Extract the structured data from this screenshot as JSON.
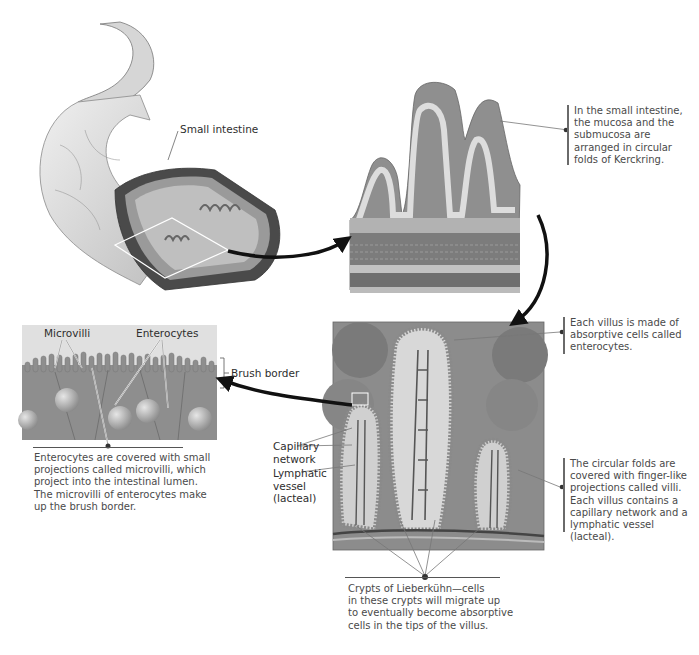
{
  "figure": {
    "panels": {
      "intestine": {
        "label": "Small intestine"
      },
      "folds": {
        "caption": [
          "In the small intestine,",
          "the mucosa and the",
          "submucosa are",
          "arranged in circular",
          "folds of Kerckring."
        ]
      },
      "villus": {
        "caption": [
          "Each villus is made of",
          "absorptive cells called",
          "enterocytes."
        ],
        "caption2": [
          "The circular folds are",
          "covered with finger-like",
          "projections called villi.",
          "Each villus contains a",
          "capillary network and a",
          "lymphatic vessel (lacteal)."
        ],
        "labels": {
          "capillary": [
            "Capillary",
            "network"
          ],
          "lymphatic": [
            "Lymphatic",
            "vessel",
            "(lacteal)"
          ]
        },
        "crypts_caption": [
          "Crypts of Lieberkühn—cells",
          "in these crypts will migrate up",
          "to eventually become absorptive",
          "cells in the tips of the villus."
        ]
      },
      "enterocytes": {
        "labels": {
          "microvilli": "Microvilli",
          "enterocytes": "Enterocytes",
          "brush_border": "Brush border"
        },
        "caption": [
          "Enterocytes are covered with small",
          "projections called microvilli, which",
          "project into the intestinal lumen.",
          "The microvilli of enterocytes make",
          "up the brush border."
        ]
      }
    },
    "colors": {
      "tissue_light": "#d9d9d9",
      "tissue_mid": "#a8a8a8",
      "tissue_dark": "#6e6e6e",
      "arrow": "#111111"
    }
  }
}
